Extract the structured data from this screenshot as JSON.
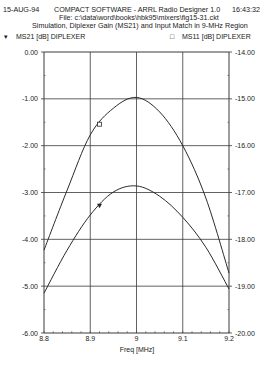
{
  "header": {
    "date": "15-AUG-94",
    "app": "COMPACT SOFTWARE - ARRL Radio Designer 1.0",
    "time": "16:43:32",
    "file": "File: c:\\data\\word\\books\\hbk95\\mixers\\fig15-31.ckt",
    "subtitle": "Simulation, Diplexer Gain (MS21) and Input Match in 9-MHz Region"
  },
  "chart_data": {
    "type": "line",
    "title": "Simulation, Diplexer Gain (MS21) and Input Match in 9-MHz Region",
    "xlabel": "Freq [MHz]",
    "ylabel_left": "MS21 [dB] DIPLEXER",
    "ylabel_right": "MS11 [dB] DIPLEXER",
    "x": [
      8.8,
      8.85,
      8.9,
      8.95,
      9.0,
      9.05,
      9.1,
      9.15,
      9.2
    ],
    "xlim": [
      8.8,
      9.2
    ],
    "xticks": [
      "8.8",
      "8.9",
      "9",
      "9.1",
      "9.2"
    ],
    "xtick_values": [
      8.8,
      8.9,
      9.0,
      9.1,
      9.2
    ],
    "ylim_left": [
      -6,
      0
    ],
    "ylim_right": [
      -20,
      -14
    ],
    "yticks_left": [
      "0.00",
      "-1.00",
      "-2.00",
      "-3.00",
      "-4.00",
      "-5.00",
      "-6.00"
    ],
    "yticks_right": [
      "-14.00",
      "-15.00",
      "-16.00",
      "-17.00",
      "-18.00",
      "-19.00",
      "-20.00"
    ],
    "grid": true,
    "legend": "top",
    "series": [
      {
        "name": "MS21 [dB] DIPLEXER",
        "axis": "left",
        "marker": "triangle-down",
        "marker_symbol": "▾",
        "marker_x": 8.92,
        "values": [
          -5.15,
          -4.23,
          -3.48,
          -2.99,
          -2.86,
          -3.08,
          -3.53,
          -4.17,
          -5.06
        ]
      },
      {
        "name": "MS11 [dB] DIPLEXER",
        "axis": "right",
        "marker": "square",
        "marker_symbol": "□",
        "marker_x": 8.92,
        "values": [
          -18.23,
          -16.95,
          -15.77,
          -15.2,
          -14.97,
          -15.28,
          -16.0,
          -17.12,
          -18.72
        ]
      }
    ]
  },
  "colors": {
    "line": "#2a2a2a",
    "grid": "#3a3a3a",
    "text": "#1a1a1a"
  }
}
